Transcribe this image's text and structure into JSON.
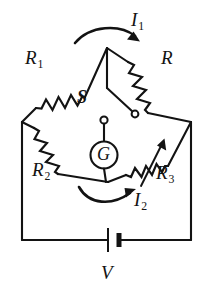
{
  "figure": {
    "type": "circuit-diagram",
    "ink_color": "#131313",
    "background_color": "#ffffff"
  },
  "labels": {
    "r1": {
      "symbol": "R",
      "subscript": "1",
      "component": "resistor"
    },
    "r": {
      "symbol": "R",
      "subscript": "",
      "component": "resistor"
    },
    "r2": {
      "symbol": "R",
      "subscript": "2",
      "component": "resistor"
    },
    "r3": {
      "symbol": "R",
      "subscript": "3",
      "component": "variable-resistor"
    },
    "i1": {
      "symbol": "I",
      "subscript": "1",
      "component": "current"
    },
    "i2": {
      "symbol": "I",
      "subscript": "2",
      "component": "current"
    },
    "s": {
      "symbol": "S",
      "subscript": "",
      "component": "switch"
    },
    "g": {
      "symbol": "G",
      "subscript": "",
      "component": "galvanometer"
    },
    "v": {
      "symbol": "V",
      "subscript": "",
      "component": "battery"
    }
  },
  "icons": {
    "galvanometer": "galvanometer-icon",
    "switch": "switch-icon",
    "battery": "battery-icon",
    "resistor": "resistor-icon",
    "variable_resistor": "variable-resistor-icon",
    "current_arrow": "current-arrow-icon"
  }
}
